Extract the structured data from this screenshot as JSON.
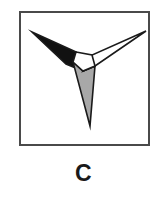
{
  "figure": {
    "caption": "C",
    "frame": {
      "border_color": "#4a4a4a",
      "background_color": "#ffffff",
      "border_width_px": 2,
      "x": 19,
      "y": 11,
      "width": 131,
      "height": 135
    },
    "shape": {
      "name": "three-armed-pinwheel",
      "description": "Tri-radiate pointed star with three tapering arms meeting at a small white central polygon",
      "outline_color": "#1a1a1a",
      "outline_width_px": 1.6,
      "center": {
        "x": 83,
        "y": 66
      },
      "center_polygon": {
        "fill": "#ffffff",
        "points": "76,52 92,55 95,66 83,71 73,62"
      },
      "arms": [
        {
          "id": "upper-left-arm",
          "label": "black arm",
          "fill": "#111111",
          "tip": {
            "x": 32,
            "y": 32
          },
          "points": "32,32 76,52 73,62 83,71 66,64"
        },
        {
          "id": "upper-right-arm",
          "label": "white arm",
          "fill": "#ffffff",
          "tip": {
            "x": 146,
            "y": 31
          },
          "points": "146,31 95,66 83,71 92,55"
        },
        {
          "id": "lower-arm",
          "label": "gray arm",
          "fill": "#a8a8a8",
          "tip": {
            "x": 90,
            "y": 126
          },
          "points": "73,62 83,71 95,66 90,126"
        }
      ]
    }
  }
}
